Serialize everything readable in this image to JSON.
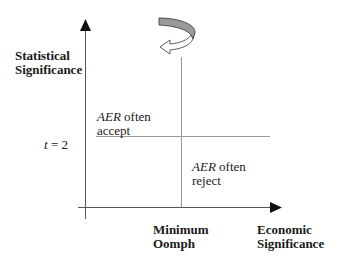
{
  "diagram": {
    "y_axis_label": [
      "Statistical",
      "Significance"
    ],
    "x_axis_label": [
      "Economic",
      "Significance"
    ],
    "threshold_label": "t = 2",
    "threshold_var": "t",
    "threshold_eq": "= 2",
    "vertical_line_label": [
      "Minimum",
      "Oomph"
    ],
    "region_upper_left": {
      "italic": "AER",
      "rest_line1": " often",
      "line2": "accept"
    },
    "region_lower_right": {
      "italic": "AER",
      "rest_line1": " often",
      "line2": "reject"
    },
    "rotation_icon": "curved-rotate-arrow-icon",
    "colors": {
      "axis": "#1a1a1a",
      "line": "#9a9a9a",
      "arrow_fill": "#9a9a9a"
    }
  }
}
